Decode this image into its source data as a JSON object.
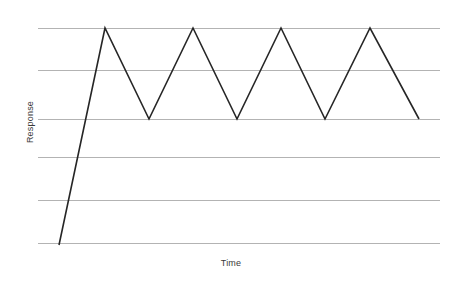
{
  "chart_data": {
    "type": "line",
    "title": "",
    "subtitle": "",
    "xlabel": "Time",
    "ylabel": "Response",
    "grid": "horizontal",
    "gridlines": 6,
    "legend": "none",
    "xlim": [
      0,
      10
    ],
    "ylim": [
      0,
      5
    ],
    "x_ticklabels": [],
    "y_ticklabels": [],
    "annotations": [],
    "series": [
      {
        "name": "Response",
        "color": "#262626",
        "x": [
          0.0,
          1.1,
          2.2,
          3.3,
          4.4,
          5.5,
          6.6,
          7.7,
          8.8
        ],
        "y": [
          0.0,
          5.0,
          2.9,
          5.0,
          2.9,
          5.0,
          2.9,
          5.0,
          2.9
        ],
        "points_px": [
          {
            "x": 59,
            "y": 245
          },
          {
            "x": 105,
            "y": 28
          },
          {
            "x": 149,
            "y": 119
          },
          {
            "x": 193,
            "y": 28
          },
          {
            "x": 237,
            "y": 119
          },
          {
            "x": 281,
            "y": 28
          },
          {
            "x": 325,
            "y": 119
          },
          {
            "x": 370,
            "y": 28
          },
          {
            "x": 419,
            "y": 119
          }
        ]
      }
    ],
    "gridline_y_values": [
      5.0,
      4.0,
      2.9,
      2.0,
      1.0,
      0.0
    ],
    "gridlines_px": [
      28,
      70,
      119,
      157,
      200,
      243
    ],
    "grid_x_start_px": 38,
    "grid_x_end_px": 440,
    "colors": {
      "line": "#262626",
      "grid": "#b3b3b3",
      "background": "#ffffff",
      "label_text": "#3a3a3a"
    }
  }
}
